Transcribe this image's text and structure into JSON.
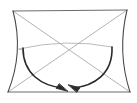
{
  "canvas": {
    "width": 137,
    "height": 103,
    "background": "#ffffff",
    "title": "geometric fold diagram"
  },
  "palette": {
    "outline_dark": "#3f3f3f",
    "outline_light": "#9a9a9a",
    "crease_light": "#a8a8a8",
    "arrow_dark": "#2b2b2b",
    "background": "#ffffff"
  },
  "stroke_widths": {
    "frame": 1.1,
    "crease": 0.8,
    "arrow": 1.6
  },
  "vertices": {
    "top_left": {
      "x": 13,
      "y": 11
    },
    "top_right": {
      "x": 127,
      "y": 10
    },
    "bottom_left": {
      "x": 8,
      "y": 92
    },
    "bottom_right": {
      "x": 130,
      "y": 92
    },
    "center": {
      "x": 66,
      "y": 43
    }
  },
  "edges": [
    {
      "name": "top-edge",
      "kind": "straight",
      "from": "top_left",
      "to": "top_right",
      "color": "#6d6d6d"
    },
    {
      "name": "bottom-edge",
      "kind": "straight",
      "from": "bottom_left",
      "to": "bottom_right",
      "color": "#6d6d6d"
    },
    {
      "name": "left-edge",
      "kind": "curved-concave",
      "from": "top_left",
      "to": "bottom_left",
      "control": {
        "x": 24,
        "y": 52
      },
      "color": "#4a4a4a"
    },
    {
      "name": "right-edge",
      "kind": "curved-concave",
      "from": "top_right",
      "to": "bottom_right",
      "control": {
        "x": 117,
        "y": 52
      },
      "color": "#4a4a4a"
    }
  ],
  "creases": [
    {
      "name": "diagonal-tl-br",
      "kind": "straight",
      "from": "top_left",
      "to": "bottom_right",
      "color": "#a0a0a0"
    },
    {
      "name": "diagonal-tr-bl",
      "kind": "straight",
      "from": "top_right",
      "to": "bottom_left",
      "color": "#a0a0a0"
    },
    {
      "name": "horizontal-crease",
      "kind": "curved",
      "from": {
        "x": 19,
        "y": 49
      },
      "to": {
        "x": 112,
        "y": 47
      },
      "control": {
        "x": 66,
        "y": 38
      },
      "color": "#a8a8a8"
    },
    {
      "name": "left-crease-stub",
      "kind": "straight",
      "from": {
        "x": 19,
        "y": 49
      },
      "to": {
        "x": 22,
        "y": 50
      },
      "color": "#a8a8a8"
    }
  ],
  "arrows": [
    {
      "name": "left-fold-arrow",
      "start": {
        "x": 23,
        "y": 48
      },
      "control1": {
        "x": 23,
        "y": 74
      },
      "control2": {
        "x": 42,
        "y": 86
      },
      "end": {
        "x": 63,
        "y": 88
      },
      "head_angle_deg": 35,
      "color": "#2b2b2b",
      "direction": "down-right"
    },
    {
      "name": "right-fold-arrow",
      "start": {
        "x": 112,
        "y": 47
      },
      "control1": {
        "x": 113,
        "y": 74
      },
      "control2": {
        "x": 94,
        "y": 86
      },
      "end": {
        "x": 73,
        "y": 88
      },
      "head_angle_deg": 215,
      "color": "#2b2b2b",
      "direction": "down-left"
    }
  ],
  "labels": {
    "none": ""
  }
}
